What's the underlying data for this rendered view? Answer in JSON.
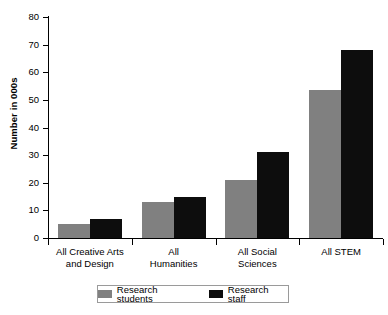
{
  "chart_data": {
    "type": "bar",
    "title": "",
    "xlabel": "",
    "ylabel": "Number in 000s",
    "ylim": [
      0,
      80
    ],
    "yticks": [
      0,
      10,
      20,
      30,
      40,
      50,
      60,
      70,
      80
    ],
    "grid": false,
    "legend_position": "bottom",
    "categories": [
      "All Creative Arts and Design",
      "All Humanities",
      "All Social Sciences",
      "All STEM"
    ],
    "category_lines": [
      [
        "All Creative Arts",
        "and Design"
      ],
      [
        "All",
        "Humanities"
      ],
      [
        "All Social",
        "Sciences"
      ],
      [
        "All STEM"
      ]
    ],
    "series": [
      {
        "name": "Research students",
        "color": "#808080",
        "values": [
          5,
          13,
          21,
          53.5
        ]
      },
      {
        "name": "Research staff",
        "color": "#0d0d0d",
        "values": [
          6.8,
          15,
          31,
          68
        ]
      }
    ]
  },
  "legend": {
    "items": [
      {
        "label": "Research students",
        "swatch": "students"
      },
      {
        "label": "Research staff",
        "swatch": "staff"
      }
    ]
  }
}
